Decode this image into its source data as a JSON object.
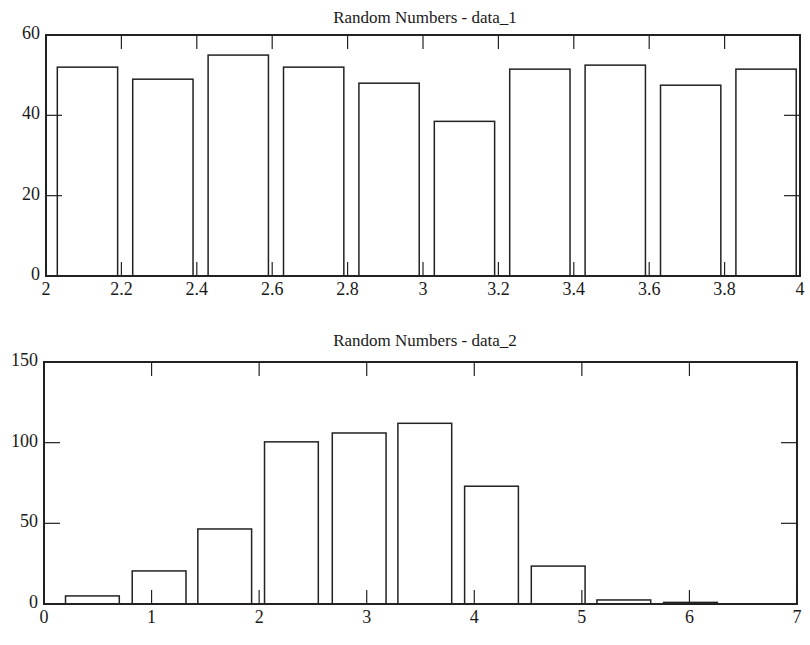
{
  "chart_data": [
    {
      "type": "bar",
      "title": "Random Numbers - data_1",
      "xlabel": "",
      "ylabel": "",
      "xlim": [
        2,
        4
      ],
      "ylim": [
        0,
        60
      ],
      "xticks": [
        "2",
        "2.2",
        "2.4",
        "2.6",
        "2.8",
        "3",
        "3.2",
        "3.4",
        "3.6",
        "3.8",
        "4"
      ],
      "yticks": [
        "0",
        "20",
        "40",
        "60"
      ],
      "grid": false,
      "bins": [
        {
          "x0": 2.03,
          "x1": 2.19
        },
        {
          "x0": 2.23,
          "x1": 2.39
        },
        {
          "x0": 2.43,
          "x1": 2.59
        },
        {
          "x0": 2.63,
          "x1": 2.79
        },
        {
          "x0": 2.83,
          "x1": 2.99
        },
        {
          "x0": 3.03,
          "x1": 3.19
        },
        {
          "x0": 3.23,
          "x1": 3.39
        },
        {
          "x0": 3.43,
          "x1": 3.59
        },
        {
          "x0": 3.63,
          "x1": 3.79
        },
        {
          "x0": 3.83,
          "x1": 3.99
        }
      ],
      "categories": [
        "2.1",
        "2.3",
        "2.5",
        "2.7",
        "2.9",
        "3.1",
        "3.3",
        "3.5",
        "3.7",
        "3.9"
      ],
      "values": [
        52,
        49,
        55,
        52,
        48,
        38.5,
        51.5,
        52.5,
        47.5,
        51.5
      ]
    },
    {
      "type": "bar",
      "title": "Random Numbers - data_2",
      "xlabel": "",
      "ylabel": "",
      "xlim": [
        0,
        7
      ],
      "ylim": [
        0,
        150
      ],
      "xticks": [
        "0",
        "1",
        "2",
        "3",
        "4",
        "5",
        "6",
        "7"
      ],
      "yticks": [
        "0",
        "50",
        "100",
        "150"
      ],
      "grid": false,
      "bins": [
        {
          "x0": 0.2,
          "x1": 0.7
        },
        {
          "x0": 0.82,
          "x1": 1.32
        },
        {
          "x0": 1.43,
          "x1": 1.93
        },
        {
          "x0": 2.05,
          "x1": 2.55
        },
        {
          "x0": 2.68,
          "x1": 3.18
        },
        {
          "x0": 3.29,
          "x1": 3.79
        },
        {
          "x0": 3.91,
          "x1": 4.41
        },
        {
          "x0": 4.53,
          "x1": 5.03
        },
        {
          "x0": 5.14,
          "x1": 5.64
        },
        {
          "x0": 5.76,
          "x1": 6.26
        }
      ],
      "categories": [
        "0.45",
        "1.07",
        "1.68",
        "2.3",
        "2.93",
        "3.54",
        "4.16",
        "4.78",
        "5.39",
        "6.01"
      ],
      "values": [
        5,
        20.5,
        46.5,
        100.5,
        106,
        112,
        73,
        23.5,
        2.5,
        1
      ]
    }
  ]
}
